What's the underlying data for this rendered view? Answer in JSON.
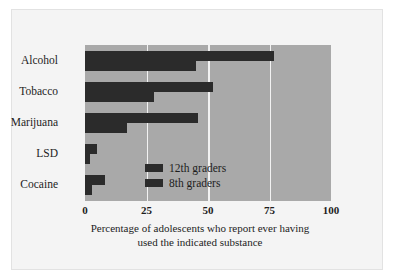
{
  "chart_data": {
    "type": "bar",
    "orientation": "horizontal",
    "title": "",
    "xlabel": "Percentage of adolescents who report ever having used the indicated substance",
    "ylabel": "",
    "xlim": [
      0,
      100
    ],
    "xticks": [
      "0",
      "25",
      "50",
      "75",
      "100"
    ],
    "grid": true,
    "legend_position": "inside-center-lower",
    "categories": [
      "Alcohol",
      "Tobacco",
      "Marijuana",
      "LSD",
      "Cocaine"
    ],
    "series": [
      {
        "name": "12th graders",
        "values": [
          77,
          52,
          46,
          5,
          8
        ]
      },
      {
        "name": "8th graders",
        "values": [
          45,
          28,
          17,
          2,
          3
        ]
      }
    ]
  },
  "axis": {
    "caption_line1": "Percentage of adolescents who report ever having",
    "caption_line2": "used the indicated substance",
    "ticks": [
      {
        "label": "0",
        "value": 0
      },
      {
        "label": "25",
        "value": 25
      },
      {
        "label": "50",
        "value": 50
      },
      {
        "label": "75",
        "value": 75
      },
      {
        "label": "100",
        "value": 100
      }
    ]
  },
  "legend": {
    "items": [
      {
        "label": "12th graders"
      },
      {
        "label": "8th graders"
      }
    ]
  },
  "colors": {
    "bar": "#2b2b2b",
    "plot_background": "#a9a9a9",
    "gridline": "#f2f2f2",
    "figure_background": "#f4f4f4",
    "text": "#1d1d1d"
  }
}
